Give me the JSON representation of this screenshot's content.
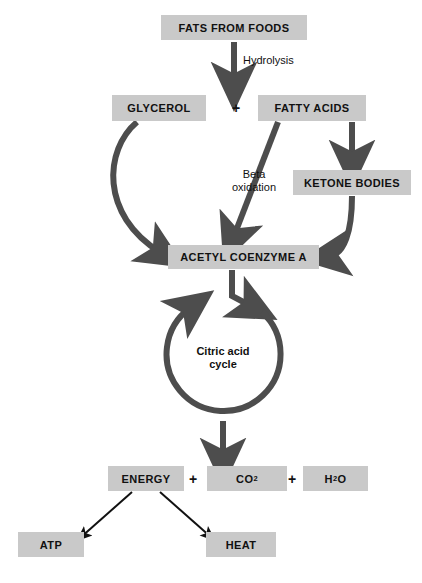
{
  "diagram": {
    "colors": {
      "box_fill": "#c9c9c9",
      "arrow_thick": "#4d4d4d",
      "arrow_thin": "#111111",
      "text": "#111111",
      "background": "#ffffff"
    },
    "nodes": [
      {
        "id": "fats",
        "label": "FATS FROM FOODS",
        "x": 161,
        "y": 15,
        "w": 146,
        "h": 25
      },
      {
        "id": "glycerol",
        "label": "GLYCEROL",
        "x": 112,
        "y": 95,
        "w": 94,
        "h": 26
      },
      {
        "id": "fatty",
        "label": "FATTY ACIDS",
        "x": 258,
        "y": 95,
        "w": 108,
        "h": 26
      },
      {
        "id": "ketone",
        "label": "KETONE BODIES",
        "x": 293,
        "y": 170,
        "w": 118,
        "h": 25
      },
      {
        "id": "acetyl",
        "label": "ACETYL COENZYME A",
        "x": 168,
        "y": 245,
        "w": 151,
        "h": 24
      },
      {
        "id": "energy",
        "label": "ENERGY",
        "x": 108,
        "y": 466,
        "w": 76,
        "h": 25
      },
      {
        "id": "co2",
        "label": "CO2",
        "x": 207,
        "y": 466,
        "w": 80,
        "h": 25
      },
      {
        "id": "h2o",
        "label": "H2O",
        "x": 303,
        "y": 466,
        "w": 65,
        "h": 25
      },
      {
        "id": "atp",
        "label": "ATP",
        "x": 18,
        "y": 532,
        "w": 66,
        "h": 25
      },
      {
        "id": "heat",
        "label": "HEAT",
        "x": 206,
        "y": 532,
        "w": 70,
        "h": 25
      }
    ],
    "plus_signs": [
      {
        "id": "plus-glycerol-fatty",
        "label": "+",
        "x": 228,
        "y": 97,
        "w": 16,
        "h": 22
      },
      {
        "id": "plus-energy-co2",
        "label": "+",
        "x": 185,
        "y": 468,
        "w": 16,
        "h": 22
      },
      {
        "id": "plus-co2-h2o",
        "label": "+",
        "x": 284,
        "y": 468,
        "w": 16,
        "h": 22
      }
    ],
    "edge_labels": [
      {
        "id": "hydrolysis",
        "label": "Hydrolysis",
        "x": 243,
        "y": 54
      },
      {
        "id": "beta-oxidation",
        "label": "Beta\noxidation",
        "x": 232,
        "y": 168
      }
    ],
    "cycle": {
      "id": "citric-acid-cycle",
      "label": "Citric acid\ncycle",
      "cx": 223,
      "cy": 358,
      "r": 57
    },
    "formulas": {
      "co2": {
        "base": "CO",
        "sub": "2"
      },
      "h2o": {
        "base_a": "H",
        "sub": "2",
        "base_b": "O"
      }
    }
  }
}
